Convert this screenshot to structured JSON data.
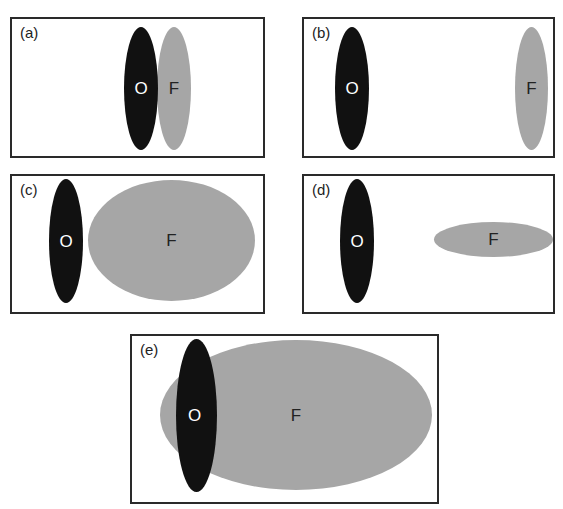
{
  "figure": {
    "colors": {
      "other_fill": "#111111",
      "focal_fill": "#a6a6a6",
      "border": "#2a2a2a",
      "other_text": "#ffffff",
      "focal_text": "#222222"
    },
    "panels": [
      {
        "id": "a",
        "label": "(a)",
        "other": {
          "label": "O"
        },
        "focal": {
          "label": "F"
        }
      },
      {
        "id": "b",
        "label": "(b)",
        "other": {
          "label": "O"
        },
        "focal": {
          "label": "F"
        }
      },
      {
        "id": "c",
        "label": "(c)",
        "other": {
          "label": "O"
        },
        "focal": {
          "label": "F"
        }
      },
      {
        "id": "d",
        "label": "(d)",
        "other": {
          "label": "O"
        },
        "focal": {
          "label": "F"
        }
      },
      {
        "id": "e",
        "label": "(e)",
        "other": {
          "label": "O"
        },
        "focal": {
          "label": "F"
        }
      }
    ]
  }
}
